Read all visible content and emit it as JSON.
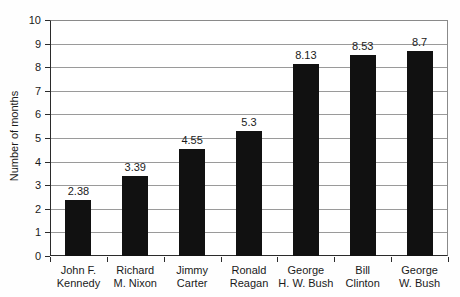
{
  "chart_data": {
    "type": "bar",
    "title": "",
    "ylabel": "Number of months",
    "xlabel": "",
    "categories": [
      "John F.\nKennedy",
      "Richard\nM. Nixon",
      "Jimmy\nCarter",
      "Ronald\nReagan",
      "George\nH. W. Bush",
      "Bill\nClinton",
      "George\nW. Bush"
    ],
    "values": [
      2.38,
      3.39,
      4.55,
      5.3,
      8.13,
      8.53,
      8.7
    ],
    "value_labels": [
      "2.38",
      "3.39",
      "4.55",
      "5.3",
      "8.13",
      "8.53",
      "8.7"
    ],
    "ylim": [
      0,
      10
    ],
    "yticks": [
      0,
      1,
      2,
      3,
      4,
      5,
      6,
      7,
      8,
      9,
      10
    ],
    "grid": "horizontal",
    "legend": "none",
    "bar_color": "#111111",
    "gridline_color": "#9a9a9a",
    "axis_color": "#2b2b2b",
    "background_color": "#ffffff"
  }
}
